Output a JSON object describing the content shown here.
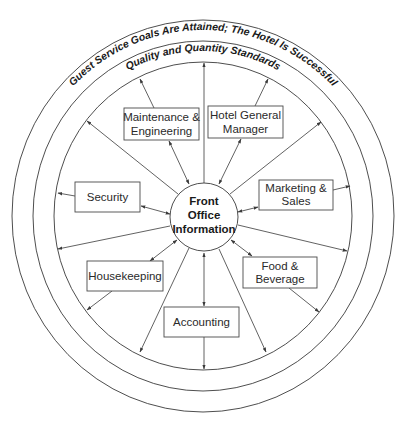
{
  "diagram": {
    "outer_ring_label": "Guest Service Goals Are Attained; The Hotel Is Successful",
    "inner_ring_label": "Quality and Quantity Standards",
    "hub": {
      "lines": [
        "Front",
        "Office",
        "Information"
      ]
    },
    "departments": [
      {
        "id": "maintenance",
        "lines": [
          "Maintenance &",
          "Engineering"
        ]
      },
      {
        "id": "general-manager",
        "lines": [
          "Hotel General",
          "Manager"
        ]
      },
      {
        "id": "security",
        "lines": [
          "Security"
        ]
      },
      {
        "id": "marketing",
        "lines": [
          "Marketing &",
          "Sales"
        ]
      },
      {
        "id": "housekeeping",
        "lines": [
          "Housekeeping"
        ]
      },
      {
        "id": "food-beverage",
        "lines": [
          "Food &",
          "Beverage"
        ]
      },
      {
        "id": "accounting",
        "lines": [
          "Accounting"
        ]
      }
    ],
    "colors": {
      "stroke": "#3a3a3a",
      "text": "#1a1a1a",
      "background": "#ffffff"
    }
  }
}
